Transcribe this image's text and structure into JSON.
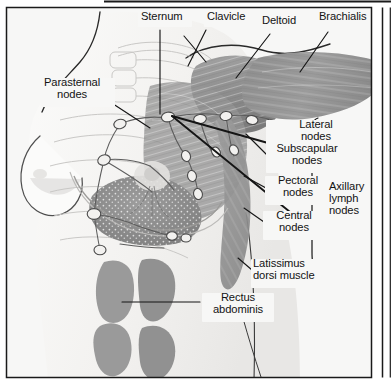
{
  "figure": {
    "title_fragment": "",
    "frame": {
      "border_color": "#1a1a1a",
      "outer_background": "#ffffff",
      "panel_background": "#f7f7f6"
    },
    "palette": {
      "text": "#131313",
      "leader_line": "#151515",
      "muscle_mid": "#8e8e8e",
      "muscle_dark": "#7a7a7a",
      "muscle_light": "#a8a8a8",
      "rectus": "#9a9a9a",
      "skin": "#f1f0ef",
      "skin_shadow": "#dcdbd9",
      "node_fill": "#f2f1ef",
      "node_stroke": "#4a4a4a",
      "vessel": "#5d5d5d",
      "bone_line": "#c6c5c3",
      "gland_fill": "#8b8b8b"
    },
    "labels": [
      {
        "id": "sternum",
        "text": "Sternum",
        "lines": [
          "Sternum"
        ],
        "x": 141,
        "y": 16,
        "align": "left"
      },
      {
        "id": "clavicle",
        "text": "Clavicle",
        "lines": [
          "Clavicle"
        ],
        "x": 207,
        "y": 16,
        "align": "left"
      },
      {
        "id": "deltoid",
        "text": "Deltoid",
        "lines": [
          "Deltoid"
        ],
        "x": 262,
        "y": 20,
        "align": "left"
      },
      {
        "id": "brachialis",
        "text": "Brachialis",
        "lines": [
          "Brachialis"
        ],
        "x": 319,
        "y": 16,
        "align": "left"
      },
      {
        "id": "parasternal-nodes",
        "text": "Parasternal nodes",
        "lines": [
          "Parasternal",
          "nodes"
        ],
        "x": 44,
        "y": 82,
        "align": "left"
      },
      {
        "id": "lateral-nodes",
        "text": "Lateral nodes",
        "lines": [
          "Lateral",
          "nodes"
        ],
        "x": 291,
        "y": 124,
        "align": "left"
      },
      {
        "id": "subscapular-nodes",
        "text": "Subscapular nodes",
        "lines": [
          "Subscapular",
          "nodes"
        ],
        "x": 270,
        "y": 148,
        "align": "left"
      },
      {
        "id": "pectoral-nodes",
        "text": "Pectoral nodes",
        "lines": [
          "Pectoral",
          "nodes"
        ],
        "x": 268,
        "y": 180,
        "align": "left"
      },
      {
        "id": "axillary-lymph-nodes",
        "text": "Axillary lymph nodes",
        "lines": [
          "Axillary",
          "lymph",
          "nodes"
        ],
        "x": 329,
        "y": 186,
        "align": "left"
      },
      {
        "id": "central-nodes",
        "text": "Central nodes",
        "lines": [
          "Central",
          "nodes"
        ],
        "x": 266,
        "y": 215,
        "align": "left"
      },
      {
        "id": "latissimus-dorsi",
        "text": "Latissimus dorsi muscle",
        "lines": [
          "Latissimus",
          "dorsi muscle"
        ],
        "x": 254,
        "y": 263,
        "align": "left"
      },
      {
        "id": "rectus-abdominis",
        "text": "Rectus abdominis",
        "lines": [
          "Rectus",
          "abdominis"
        ],
        "x": 205,
        "y": 297,
        "align": "left"
      }
    ],
    "structures": [
      {
        "id": "deltoid-muscle",
        "name": "Deltoid"
      },
      {
        "id": "brachialis-muscle",
        "name": "Brachialis"
      },
      {
        "id": "pectoralis-major",
        "name": "Pectoralis major"
      },
      {
        "id": "latissimus-dorsi-muscle",
        "name": "Latissimus dorsi muscle"
      },
      {
        "id": "rectus-abdominis-muscle",
        "name": "Rectus abdominis"
      },
      {
        "id": "sternum-bone",
        "name": "Sternum"
      },
      {
        "id": "clavicle-bone",
        "name": "Clavicle"
      },
      {
        "id": "breast-gland",
        "name": "Mammary gland tissue"
      },
      {
        "id": "nipple",
        "name": "Nipple"
      },
      {
        "id": "lymph-node-chain",
        "name": "Lymphatic vessels and nodes"
      }
    ]
  }
}
